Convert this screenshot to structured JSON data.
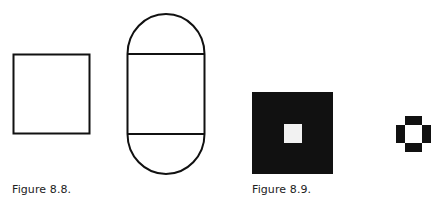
{
  "figures": [
    {
      "caption": "Figure 8.8.",
      "shapes": [
        "outlined-square",
        "capsule-with-two-horizontal-lines"
      ]
    },
    {
      "caption": "Figure 8.9.",
      "shapes": [
        "black-square-with-white-center",
        "pixel-ring"
      ]
    }
  ],
  "colors": {
    "ink": "#111111",
    "paper": "#ffffff"
  }
}
